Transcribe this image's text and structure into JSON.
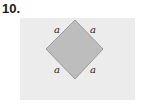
{
  "problem_number": "10.",
  "figure": {
    "shape": "square-rotated-45",
    "fill_color": "#bdbdbd",
    "stroke_color": "#9a9a9a",
    "background_color": "#ececec",
    "side_labels": [
      "a",
      "a",
      "a",
      "a"
    ]
  }
}
